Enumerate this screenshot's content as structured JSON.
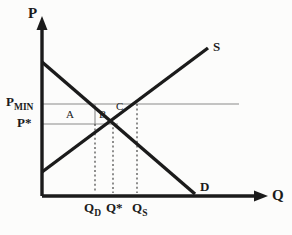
{
  "figure": {
    "kind": "supply-demand-diagram",
    "background_color": "#fcfcfb",
    "ink_color": "#1b1b1b",
    "thin_line_color": "#8a8a8a"
  },
  "axes": {
    "vertical_label": "P",
    "horizontal_label": "Q",
    "origin": {
      "x": 42,
      "y": 196
    },
    "vertical_top": 22,
    "horizontal_right": 262
  },
  "curves": [
    {
      "name": "supply",
      "label": "S",
      "label_x": 215,
      "label_y": 40,
      "from": {
        "x": 42,
        "y": 172
      },
      "to": {
        "x": 208,
        "y": 48
      }
    },
    {
      "name": "demand",
      "label": "D",
      "label_x": 202,
      "label_y": 181,
      "from": {
        "x": 42,
        "y": 62
      },
      "to": {
        "x": 195,
        "y": 194
      }
    }
  ],
  "price_lines": [
    {
      "name": "price-floor",
      "label": "P",
      "subscript": "MIN",
      "value_y": 104,
      "extends_to_x": 239,
      "label_x": 6,
      "label_y": 96
    },
    {
      "name": "equilibrium-price",
      "label": "P*",
      "subscript": "",
      "value_y": 124,
      "extends_to_x": 118,
      "label_x": 17,
      "label_y": 117
    }
  ],
  "quantity_lines": [
    {
      "name": "quantity-demanded",
      "label": "Q",
      "subscript": "D",
      "x": 95,
      "label_x": 84,
      "label_y": 203
    },
    {
      "name": "equilibrium-quantity",
      "label": "Q*",
      "subscript": "",
      "x": 113,
      "label_x": 106,
      "label_y": 203
    },
    {
      "name": "quantity-supplied",
      "label": "Q",
      "subscript": "S",
      "x": 137,
      "label_x": 133,
      "label_y": 203
    }
  ],
  "area_labels": [
    {
      "name": "area-a",
      "text": "A",
      "x": 68,
      "y": 115
    },
    {
      "name": "area-b",
      "text": "B",
      "x": 100,
      "y": 115
    }
  ],
  "point_labels": [
    {
      "name": "point-c",
      "text": "C",
      "x": 117,
      "y": 107
    }
  ]
}
